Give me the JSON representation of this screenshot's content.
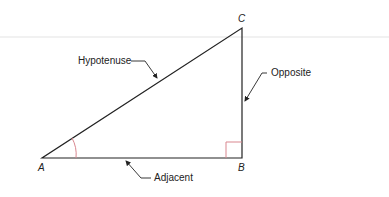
{
  "diagram": {
    "vertices": {
      "a": "A",
      "b": "B",
      "c": "C"
    },
    "labels": {
      "hypotenuse": "Hypotenuse",
      "opposite": "Opposite",
      "adjacent": "Adjacent"
    },
    "colors": {
      "line": "#222222",
      "angle_mark": "#d9878f",
      "right_angle_mark": "#d9878f"
    }
  }
}
